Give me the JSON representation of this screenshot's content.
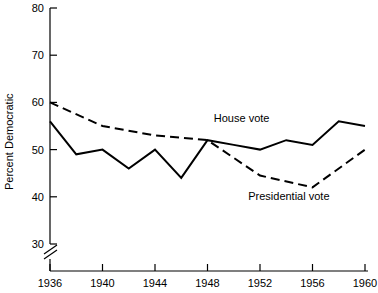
{
  "chart_data": {
    "type": "line",
    "title": "",
    "subtitle": "",
    "xlabel": "",
    "ylabel": "Percent Democratic",
    "xlim": [
      1936,
      1960
    ],
    "ylim": [
      30,
      80
    ],
    "y_axis_break_below": 30,
    "grid": false,
    "legend_position": "inline-annotation",
    "x_ticks": [
      1936,
      1940,
      1944,
      1948,
      1952,
      1956,
      1960
    ],
    "x_tick_labels": [
      "1936",
      "1940",
      "1944",
      "1948",
      "1952",
      "1956",
      "1960"
    ],
    "y_ticks": [
      30,
      40,
      50,
      60,
      70,
      80
    ],
    "y_tick_labels": [
      "30",
      "40",
      "50",
      "60",
      "70",
      "80"
    ],
    "series": [
      {
        "name": "House vote",
        "style": "solid",
        "color": "#000000",
        "x": [
          1936,
          1938,
          1940,
          1942,
          1944,
          1946,
          1948,
          1950,
          1952,
          1954,
          1956,
          1958,
          1960
        ],
        "values": [
          56,
          49,
          50,
          46,
          50,
          44,
          52,
          51,
          50,
          52,
          51,
          56,
          55
        ]
      },
      {
        "name": "Presidential vote",
        "style": "dashed",
        "color": "#000000",
        "x": [
          1936,
          1940,
          1944,
          1948,
          1952,
          1956,
          1960
        ],
        "values": [
          60,
          55,
          53,
          52,
          44.5,
          42,
          50
        ]
      }
    ],
    "annotations": [
      {
        "text": "House vote",
        "x": 1950.6,
        "y": 55.8
      },
      {
        "text": "Presidential vote",
        "x": 1954.2,
        "y": 39.4
      }
    ]
  }
}
